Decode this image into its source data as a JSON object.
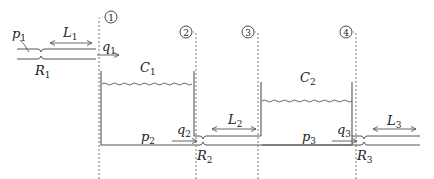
{
  "diagram": {
    "sections": [
      {
        "id": "1",
        "label": "1"
      },
      {
        "id": "2",
        "label": "2"
      },
      {
        "id": "3",
        "label": "3"
      },
      {
        "id": "4",
        "label": "4"
      }
    ],
    "labels": {
      "p1": {
        "main": "p",
        "sub": "1"
      },
      "L1": {
        "main": "L",
        "sub": "1"
      },
      "q1": {
        "main": "q",
        "sub": "1"
      },
      "R1": {
        "main": "R",
        "sub": "1"
      },
      "C1": {
        "main": "C",
        "sub": "1"
      },
      "C2": {
        "main": "C",
        "sub": "2"
      },
      "p2": {
        "main": "p",
        "sub": "2"
      },
      "q2": {
        "main": "q",
        "sub": "2"
      },
      "L2": {
        "main": "L",
        "sub": "2"
      },
      "R2": {
        "main": "R",
        "sub": "2"
      },
      "p3": {
        "main": "p",
        "sub": "3"
      },
      "q3": {
        "main": "q",
        "sub": "3"
      },
      "L3": {
        "main": "L",
        "sub": "3"
      },
      "R3": {
        "main": "R",
        "sub": "3"
      }
    },
    "colors": {
      "line": "#555555",
      "text": "#222222",
      "background": "#ffffff"
    }
  }
}
